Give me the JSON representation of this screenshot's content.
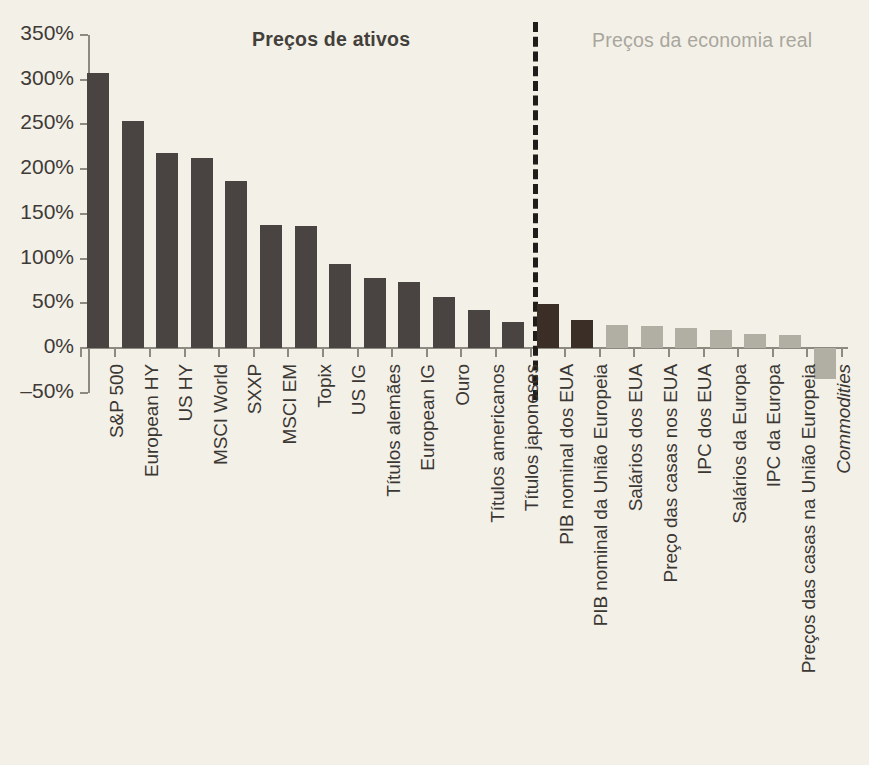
{
  "sections": {
    "assets_title": "Preços de ativos",
    "real_title": "Preços da economia real"
  },
  "axis": {
    "y_ticks": [
      "350%",
      "300%",
      "250%",
      "200%",
      "150%",
      "100%",
      "50%",
      "0%",
      "‒50%"
    ],
    "y_max": 350,
    "y_min": -50
  },
  "colors": {
    "background": "#f3f0e8",
    "bar_asset": "#494441",
    "bar_gdp": "#3a2e27",
    "bar_real": "#b1aea4",
    "axis": "#8d8a82",
    "title_assets": "#433f3a",
    "title_real": "#a9a69d",
    "divider": "#201c19"
  },
  "chart_data": {
    "type": "bar",
    "title": "",
    "xlabel": "",
    "ylabel": "",
    "ylim": [
      -50,
      350
    ],
    "grid": false,
    "legend": null,
    "unit": "%",
    "categories": [
      "S&P 500",
      "European HY",
      "US HY",
      "MSCI World",
      "SXXP",
      "MSCI EM",
      "Topix",
      "US IG",
      "Títulos alemães",
      "European IG",
      "Ouro",
      "Títulos americanos",
      "Títulos japoneses",
      "PIB nominal dos EUA",
      "PIB nominal da União Europeia",
      "Salários dos EUA",
      "Preço das casas nos EUA",
      "IPC dos EUA",
      "Salários da Europa",
      "IPC da Europa",
      "Preços das casas na União Europeia",
      "Commodities"
    ],
    "values": [
      308,
      254,
      218,
      212,
      187,
      137,
      136,
      94,
      78,
      74,
      57,
      43,
      29,
      49,
      31,
      26,
      25,
      22,
      20,
      16,
      14,
      -35
    ],
    "groups": [
      "asset",
      "asset",
      "asset",
      "asset",
      "asset",
      "asset",
      "asset",
      "asset",
      "asset",
      "asset",
      "asset",
      "asset",
      "asset",
      "gdp",
      "gdp",
      "real",
      "real",
      "real",
      "real",
      "real",
      "real",
      "real"
    ],
    "italic_labels": [
      "Commodities"
    ],
    "annotations": [
      {
        "text": "Preços de ativos",
        "applies_to": "categories 1-13"
      },
      {
        "text": "Preços da economia real",
        "applies_to": "categories 14-22"
      }
    ]
  }
}
